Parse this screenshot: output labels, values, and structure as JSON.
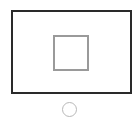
{
  "device": {
    "icon": "tablet-screen-icon",
    "screen": {
      "border_color": "#2a2a2a"
    },
    "focus_box": {
      "icon": "square-outline-icon",
      "border_color": "#9a9a9a"
    },
    "home_button": {
      "icon": "circle-button-icon",
      "border_color": "#b8b8b8"
    }
  }
}
